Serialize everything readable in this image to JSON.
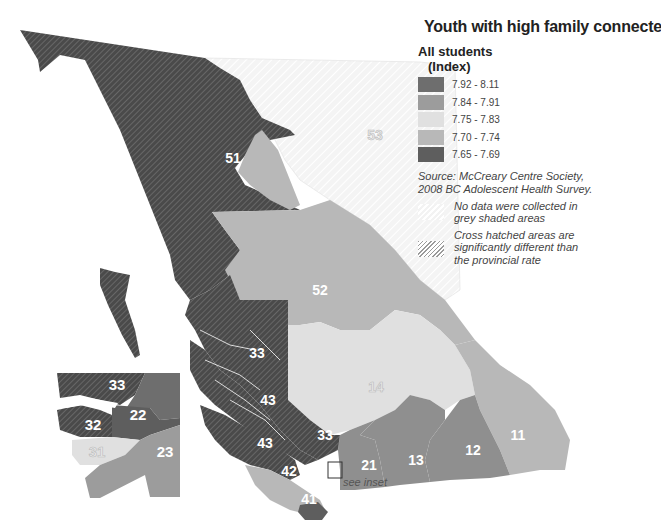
{
  "title": "Youth with high family connectedness",
  "legend": {
    "group_title_line1": "All students",
    "group_title_line2": "(Index)",
    "classes": [
      {
        "label": "7.92 - 8.11",
        "color": "#6e6e6e"
      },
      {
        "label": "7.84 - 7.91",
        "color": "#9c9c9c"
      },
      {
        "label": "7.75 - 7.83",
        "color": "#e0e0e0"
      },
      {
        "label": "7.70 - 7.74",
        "color": "#b8b8b8"
      },
      {
        "label": "7.65 - 7.69",
        "color": "#5e5e5e"
      }
    ],
    "source_line1": "Source: McCreary Centre Society,",
    "source_line2": "2008 BC Adolescent Health Survey.",
    "no_data_note": "No data were collected in grey shaded areas",
    "hatch_note": "Cross hatched areas are significantly different than the provincial rate"
  },
  "map": {
    "regions": [
      {
        "id": "51",
        "label": "51",
        "class": "7.65 - 7.69",
        "hatched": true
      },
      {
        "id": "52",
        "label": "52",
        "class": "7.70 - 7.74",
        "hatched": false
      },
      {
        "id": "53",
        "label": "53",
        "class": "no data",
        "hatched": false
      },
      {
        "id": "14",
        "label": "14",
        "class": "7.75 - 7.83",
        "hatched": false
      },
      {
        "id": "11",
        "label": "11",
        "class": "7.70 - 7.74",
        "hatched": false
      },
      {
        "id": "12",
        "label": "12",
        "class": "7.84 - 7.91",
        "hatched": false
      },
      {
        "id": "13",
        "label": "13",
        "class": "7.84 - 7.91",
        "hatched": false
      },
      {
        "id": "21",
        "label": "21",
        "class": "7.84 - 7.91",
        "hatched": false
      },
      {
        "id": "33a",
        "label": "33",
        "class": "7.65 - 7.69",
        "hatched": true
      },
      {
        "id": "33b",
        "label": "33",
        "class": "7.65 - 7.69",
        "hatched": true
      },
      {
        "id": "43a",
        "label": "43",
        "class": "7.65 - 7.69",
        "hatched": true
      },
      {
        "id": "43b",
        "label": "43",
        "class": "7.65 - 7.69",
        "hatched": true
      },
      {
        "id": "42",
        "label": "42",
        "class": "7.70 - 7.74",
        "hatched": false
      },
      {
        "id": "41",
        "label": "41",
        "class": "7.65 - 7.69",
        "hatched": false
      }
    ],
    "inset": {
      "regions": [
        {
          "id": "33",
          "label": "33",
          "hatched": true
        },
        {
          "id": "32",
          "label": "32",
          "hatched": true
        },
        {
          "id": "22",
          "label": "22",
          "hatched": false
        },
        {
          "id": "31",
          "label": "31",
          "hatched": false
        },
        {
          "id": "23",
          "label": "23",
          "hatched": false
        }
      ]
    },
    "see_inset_label": "see inset"
  }
}
